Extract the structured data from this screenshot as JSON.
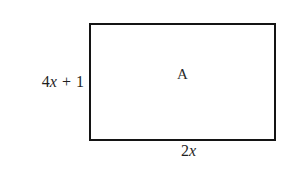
{
  "figure": {
    "type": "geometry-diagram",
    "shape": "rectangle",
    "background_color": "#ffffff",
    "stroke_color": "#141414",
    "text_color": "#1f1f1f",
    "interior_label": "A",
    "height_label": {
      "full_text": "4x + 1",
      "coefficient": "4",
      "variable": "x",
      "operator": "+",
      "constant": "1"
    },
    "width_label": {
      "full_text": "2x",
      "coefficient": "2",
      "variable": "x"
    }
  }
}
